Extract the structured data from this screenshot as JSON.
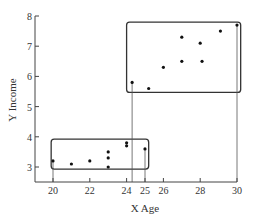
{
  "chart_data": {
    "type": "scatter",
    "title": "",
    "xlabel": "X Age",
    "ylabel": "Y Income",
    "xlim": [
      18.9,
      30
    ],
    "ylim": [
      2.5,
      8
    ],
    "x_ticks": [
      20,
      22,
      24,
      25,
      26,
      28,
      30
    ],
    "y_ticks": [
      3,
      4,
      5,
      6,
      7,
      8
    ],
    "grid": false,
    "legend": null,
    "series": [
      {
        "name": "Lower group",
        "points": [
          {
            "x": 20,
            "y": 3.2
          },
          {
            "x": 21,
            "y": 3.1
          },
          {
            "x": 22,
            "y": 3.2
          },
          {
            "x": 23,
            "y": 3.5
          },
          {
            "x": 23,
            "y": 3.3
          },
          {
            "x": 23,
            "y": 3.0
          },
          {
            "x": 24,
            "y": 3.8
          },
          {
            "x": 24,
            "y": 3.7
          },
          {
            "x": 25,
            "y": 3.6
          }
        ],
        "box": {
          "x0": 19.9,
          "x1": 25.2,
          "y0": 2.93,
          "y1": 3.92
        }
      },
      {
        "name": "Upper group",
        "points": [
          {
            "x": 24.3,
            "y": 5.8
          },
          {
            "x": 25.2,
            "y": 5.6
          },
          {
            "x": 26,
            "y": 6.3
          },
          {
            "x": 27,
            "y": 6.5
          },
          {
            "x": 27,
            "y": 7.3
          },
          {
            "x": 28,
            "y": 7.1
          },
          {
            "x": 28.1,
            "y": 6.5
          },
          {
            "x": 29.1,
            "y": 7.5
          },
          {
            "x": 30,
            "y": 7.7
          }
        ],
        "box": {
          "x0": 24.0,
          "x1": 30.2,
          "y0": 5.47,
          "y1": 7.8
        }
      }
    ],
    "drop_lines": [
      {
        "x": 20,
        "y": 3.2
      },
      {
        "x": 24.3,
        "y": 5.8
      },
      {
        "x": 25,
        "y": 3.6
      },
      {
        "x": 30,
        "y": 7.7
      }
    ]
  }
}
